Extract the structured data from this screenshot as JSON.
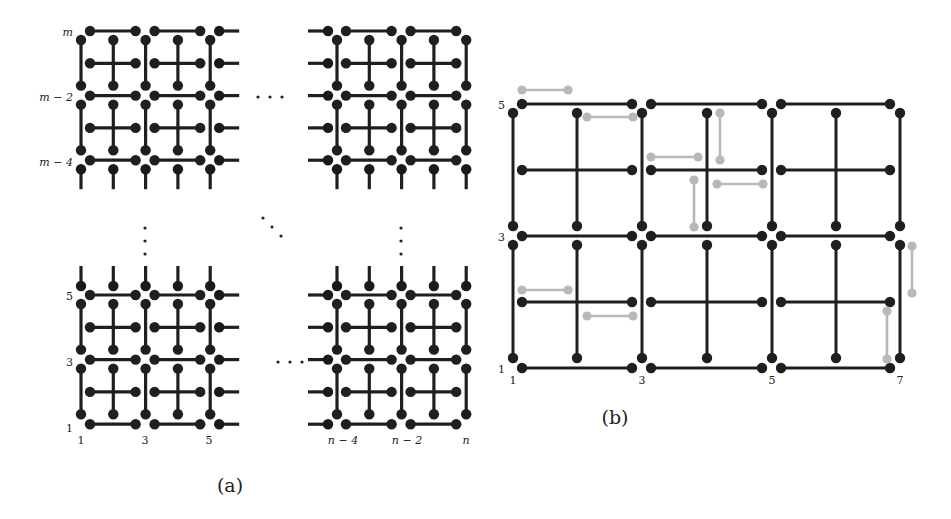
{
  "figure": {
    "panel_a": {
      "caption": "(a)",
      "caption_pos": [
        230,
        492
      ],
      "colors": {
        "edge": "#1f1f1f",
        "node": "#1a1a1a"
      },
      "blocks": [
        {
          "name": "top-left",
          "x0": 81,
          "y0": 31,
          "cols": 5,
          "rows": 5,
          "stub_right": true,
          "stub_left": false,
          "stub_bottom": true,
          "stub_top": false
        },
        {
          "name": "top-right",
          "x0": 337,
          "y0": 31,
          "cols": 5,
          "rows": 5,
          "stub_right": false,
          "stub_left": true,
          "stub_bottom": true,
          "stub_top": false
        },
        {
          "name": "bottom-left",
          "x0": 81,
          "y0": 295,
          "cols": 5,
          "rows": 5,
          "stub_right": true,
          "stub_left": false,
          "stub_bottom": false,
          "stub_top": true
        },
        {
          "name": "bottom-right",
          "x0": 337,
          "y0": 295,
          "cols": 5,
          "rows": 5,
          "stub_right": false,
          "stub_left": true,
          "stub_bottom": false,
          "stub_top": true
        }
      ],
      "step": 32.3,
      "row_labels": [
        {
          "text": "m",
          "x": 73,
          "y": 36,
          "italic": true
        },
        {
          "text": "m − 2",
          "x": 73,
          "y": 101,
          "italic": true
        },
        {
          "text": "m − 4",
          "x": 73,
          "y": 166,
          "italic": true
        },
        {
          "text": "5",
          "x": 73,
          "y": 300,
          "italic": false
        },
        {
          "text": "3",
          "x": 73,
          "y": 366,
          "italic": false
        },
        {
          "text": "1",
          "x": 73,
          "y": 432,
          "italic": false
        }
      ],
      "col_labels": [
        {
          "text": "1",
          "x": 81,
          "y": 444,
          "italic": false
        },
        {
          "text": "3",
          "x": 145,
          "y": 444,
          "italic": false
        },
        {
          "text": "5",
          "x": 209,
          "y": 444,
          "italic": false
        },
        {
          "text": "n − 4",
          "x": 343,
          "y": 444,
          "italic": true
        },
        {
          "text": "n − 2",
          "x": 407,
          "y": 444,
          "italic": true
        },
        {
          "text": "n",
          "x": 466,
          "y": 444,
          "italic": true
        }
      ],
      "ellipses": [
        {
          "kind": "horizontal",
          "x": 258,
          "y": 97
        },
        {
          "kind": "horizontal",
          "x": 278,
          "y": 362
        },
        {
          "kind": "vertical",
          "x": 145,
          "y": 228
        },
        {
          "kind": "vertical",
          "x": 401,
          "y": 228
        },
        {
          "kind": "diagonal",
          "x": 263,
          "y": 218
        }
      ]
    },
    "panel_b": {
      "caption": "(b)",
      "caption_pos": [
        615,
        424
      ],
      "colors": {
        "edge": "#1f1f1f",
        "node": "#1a1a1a",
        "ghost": "#b8b8b8"
      },
      "x_cols": [
        513,
        577,
        642,
        707,
        772,
        836,
        900
      ],
      "y_rows": [
        104,
        170,
        236,
        302,
        368
      ],
      "row_labels": [
        {
          "text": "5",
          "x": 505,
          "y": 109
        },
        {
          "text": "3",
          "x": 505,
          "y": 241
        },
        {
          "text": "1",
          "x": 505,
          "y": 373
        }
      ],
      "col_labels": [
        {
          "text": "1",
          "x": 513,
          "y": 384
        },
        {
          "text": "3",
          "x": 642,
          "y": 384
        },
        {
          "text": "5",
          "x": 772,
          "y": 384
        },
        {
          "text": "7",
          "x": 900,
          "y": 384
        }
      ],
      "ghost_segments": [
        [
          [
            522,
            90
          ],
          [
            568,
            90
          ]
        ],
        [
          [
            587,
            117
          ],
          [
            633,
            117
          ]
        ],
        [
          [
            651,
            157
          ],
          [
            698,
            157
          ]
        ],
        [
          [
            720,
            113
          ],
          [
            720,
            160
          ]
        ],
        [
          [
            694,
            180
          ],
          [
            694,
            227
          ]
        ],
        [
          [
            717,
            184
          ],
          [
            763,
            184
          ]
        ],
        [
          [
            522,
            290
          ],
          [
            568,
            290
          ]
        ],
        [
          [
            587,
            316
          ],
          [
            633,
            316
          ]
        ],
        [
          [
            912,
            246
          ],
          [
            912,
            293
          ]
        ],
        [
          [
            887,
            311
          ],
          [
            887,
            359
          ]
        ]
      ]
    }
  }
}
